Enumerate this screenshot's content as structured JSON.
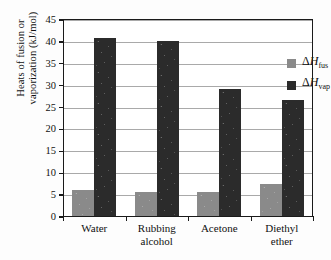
{
  "chart_data": {
    "type": "bar",
    "title": "",
    "xlabel": "",
    "ylabel_line1": "Heats of fusion or",
    "ylabel_line2": "vaporization (kJ/mol)",
    "categories": [
      "Water",
      "Rubbing\nalcohol",
      "Acetone",
      "Diethyl\nether"
    ],
    "series": [
      {
        "name": "ΔH_fus",
        "label_delta": "Δ",
        "label_h": "H",
        "label_sub": "fus",
        "color": "#8a8a8a",
        "values": [
          6.0,
          5.4,
          5.6,
          7.3
        ]
      },
      {
        "name": "ΔH_vap",
        "label_delta": "Δ",
        "label_h": "H",
        "label_sub": "vap",
        "color": "#2b2b2b",
        "values": [
          40.7,
          39.9,
          29.1,
          26.5
        ]
      }
    ],
    "ylim": [
      0,
      45
    ],
    "ytick_step": 5,
    "yticks": [
      0,
      5,
      10,
      15,
      20,
      25,
      30,
      35,
      40,
      45
    ],
    "ytick_labels": [
      "0",
      "5",
      "10",
      "15",
      "20",
      "25",
      "30",
      "35",
      "40",
      "45"
    ],
    "grid": true,
    "legend_position": "top-right-inside"
  }
}
